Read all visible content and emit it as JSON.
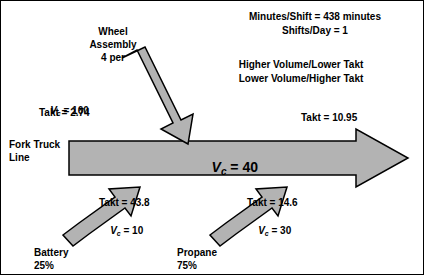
{
  "diagram": {
    "type": "process-flow-arrow",
    "title_lines": [
      "Minutes/Shift = 438 minutes",
      "Shifts/Day = 1"
    ],
    "note_lines": [
      "Higher Volume/Lower Takt",
      "Lower Volume/Higher Takt"
    ],
    "main_line_label_line1": "Fork Truck",
    "main_line_label_line2": "Line",
    "main_arrow_vc_prefix": "V",
    "main_arrow_vc_sub": "c",
    "main_arrow_vc_value": " = 40",
    "left_stats": {
      "vc_prefix": "V",
      "vc_sub": "c",
      "vc_value": " = 160",
      "takt": "Takt = 2.74"
    },
    "right_stat": {
      "takt": "Takt = 10.95"
    },
    "branches": [
      {
        "name": "wheel-assembly",
        "label_line1": "Wheel",
        "label_line2": "Assembly",
        "label_line3": "4 per"
      },
      {
        "name": "battery",
        "label_line1": "Battery",
        "label_line2": "25%",
        "takt": "Takt = 43.8",
        "vc_prefix": "V",
        "vc_sub": "c",
        "vc_value": " = 10"
      },
      {
        "name": "propane",
        "label_line1": "Propane",
        "label_line2": "75%",
        "takt": "Takt = 14.6",
        "vc_prefix": "V",
        "vc_sub": "c",
        "vc_value": " = 30"
      }
    ],
    "colors": {
      "arrow_fill": "#b3b3b3",
      "arrow_stroke": "#000000",
      "text": "#000000",
      "background": "#ffffff"
    }
  }
}
